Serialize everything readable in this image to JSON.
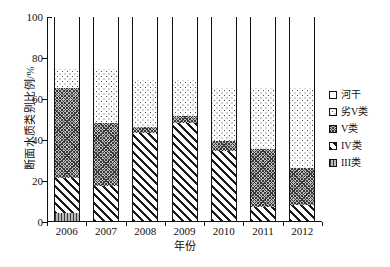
{
  "chart_data": {
    "type": "bar",
    "subtype": "stacked-100-percent",
    "title": "",
    "xlabel": "年份",
    "ylabel": "断面水质类别比例/%",
    "categories": [
      "2006",
      "2007",
      "2008",
      "2009",
      "2010",
      "2011",
      "2012"
    ],
    "ylim": [
      0,
      100
    ],
    "yticks": [
      0,
      20,
      40,
      60,
      80,
      100
    ],
    "grid": false,
    "legend_position": "right",
    "series": [
      {
        "name": "III类",
        "pattern": "grey-vertical-bars",
        "values": [
          4,
          0,
          0,
          0,
          0,
          0,
          0
        ]
      },
      {
        "name": "IV类",
        "pattern": "diagonal-hatch",
        "values": [
          17,
          17,
          43,
          48,
          34,
          7,
          8
        ]
      },
      {
        "name": "V类",
        "pattern": "grey-crosshatch",
        "values": [
          44,
          31,
          3,
          3,
          5,
          28,
          18
        ]
      },
      {
        "name": "劣V类",
        "pattern": "sparse-dots",
        "values": [
          9,
          26,
          23,
          18,
          26,
          30,
          39
        ]
      },
      {
        "name": "河干",
        "pattern": "white",
        "values": [
          26,
          26,
          31,
          31,
          35,
          35,
          35
        ]
      }
    ],
    "stack_boundaries": {
      "2006": [
        0,
        4,
        21,
        65,
        74,
        100
      ],
      "2007": [
        0,
        0,
        17,
        48,
        74,
        100
      ],
      "2008": [
        0,
        0,
        43,
        46,
        69,
        100
      ],
      "2009": [
        0,
        0,
        48,
        51,
        69,
        100
      ],
      "2010": [
        0,
        0,
        34,
        39,
        65,
        100
      ],
      "2011": [
        0,
        0,
        7,
        35,
        65,
        100
      ],
      "2012": [
        0,
        0,
        8,
        26,
        65,
        100
      ]
    }
  },
  "axis": {
    "y_title": "断面水质类别比例/%",
    "x_title": "年份",
    "y_tick_labels": [
      "0",
      "20",
      "40",
      "60",
      "80",
      "100"
    ],
    "x_tick_labels": [
      "2006",
      "2007",
      "2008",
      "2009",
      "2010",
      "2011",
      "2012"
    ]
  },
  "legend": {
    "items": [
      {
        "label": "河干",
        "key": "river-dry"
      },
      {
        "label": "劣V类",
        "key": "worse-than-v"
      },
      {
        "label": "V类",
        "key": "class-v"
      },
      {
        "label": "IV类",
        "key": "class-iv"
      },
      {
        "label": "III类",
        "key": "class-iii"
      }
    ]
  }
}
